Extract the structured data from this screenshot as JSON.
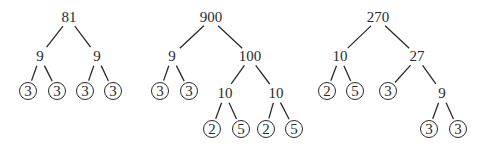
{
  "diagram": {
    "trees": [
      {
        "root": "81",
        "nodes": [
          {
            "id": "a0",
            "label": "81",
            "x": 69,
            "y": 17,
            "prime": false
          },
          {
            "id": "a1",
            "label": "9",
            "x": 40,
            "y": 56,
            "prime": false
          },
          {
            "id": "a2",
            "label": "9",
            "x": 97,
            "y": 56,
            "prime": false
          },
          {
            "id": "a3",
            "label": "3",
            "x": 28,
            "y": 91,
            "prime": true
          },
          {
            "id": "a4",
            "label": "3",
            "x": 57,
            "y": 91,
            "prime": true
          },
          {
            "id": "a5",
            "label": "3",
            "x": 85,
            "y": 91,
            "prime": true
          },
          {
            "id": "a6",
            "label": "3",
            "x": 113,
            "y": 91,
            "prime": true
          }
        ],
        "edges": [
          [
            "a0",
            "a1"
          ],
          [
            "a0",
            "a2"
          ],
          [
            "a1",
            "a3"
          ],
          [
            "a1",
            "a4"
          ],
          [
            "a2",
            "a5"
          ],
          [
            "a2",
            "a6"
          ]
        ]
      },
      {
        "root": "900",
        "nodes": [
          {
            "id": "b0",
            "label": "900",
            "x": 211,
            "y": 17,
            "prime": false
          },
          {
            "id": "b1",
            "label": "9",
            "x": 172,
            "y": 56,
            "prime": false
          },
          {
            "id": "b2",
            "label": "100",
            "x": 250,
            "y": 56,
            "prime": false
          },
          {
            "id": "b3",
            "label": "3",
            "x": 160,
            "y": 91,
            "prime": true
          },
          {
            "id": "b4",
            "label": "3",
            "x": 189,
            "y": 91,
            "prime": true
          },
          {
            "id": "b5",
            "label": "10",
            "x": 225,
            "y": 93,
            "prime": false
          },
          {
            "id": "b6",
            "label": "10",
            "x": 276,
            "y": 93,
            "prime": false
          },
          {
            "id": "b7",
            "label": "2",
            "x": 212,
            "y": 129,
            "prime": true
          },
          {
            "id": "b8",
            "label": "5",
            "x": 241,
            "y": 129,
            "prime": true
          },
          {
            "id": "b9",
            "label": "2",
            "x": 266,
            "y": 129,
            "prime": true
          },
          {
            "id": "b10",
            "label": "5",
            "x": 294,
            "y": 129,
            "prime": true
          }
        ],
        "edges": [
          [
            "b0",
            "b1"
          ],
          [
            "b0",
            "b2"
          ],
          [
            "b1",
            "b3"
          ],
          [
            "b1",
            "b4"
          ],
          [
            "b2",
            "b5"
          ],
          [
            "b2",
            "b6"
          ],
          [
            "b5",
            "b7"
          ],
          [
            "b5",
            "b8"
          ],
          [
            "b6",
            "b9"
          ],
          [
            "b6",
            "b10"
          ]
        ]
      },
      {
        "root": "270",
        "nodes": [
          {
            "id": "c0",
            "label": "270",
            "x": 378,
            "y": 17,
            "prime": false
          },
          {
            "id": "c1",
            "label": "10",
            "x": 340,
            "y": 56,
            "prime": false
          },
          {
            "id": "c2",
            "label": "27",
            "x": 417,
            "y": 56,
            "prime": false
          },
          {
            "id": "c3",
            "label": "2",
            "x": 327,
            "y": 91,
            "prime": true
          },
          {
            "id": "c4",
            "label": "5",
            "x": 355,
            "y": 91,
            "prime": true
          },
          {
            "id": "c5",
            "label": "3",
            "x": 388,
            "y": 91,
            "prime": true
          },
          {
            "id": "c6",
            "label": "9",
            "x": 442,
            "y": 93,
            "prime": false
          },
          {
            "id": "c7",
            "label": "3",
            "x": 429,
            "y": 129,
            "prime": true
          },
          {
            "id": "c8",
            "label": "3",
            "x": 458,
            "y": 129,
            "prime": true
          }
        ],
        "edges": [
          [
            "c0",
            "c1"
          ],
          [
            "c0",
            "c2"
          ],
          [
            "c1",
            "c3"
          ],
          [
            "c1",
            "c4"
          ],
          [
            "c2",
            "c5"
          ],
          [
            "c2",
            "c6"
          ],
          [
            "c6",
            "c7"
          ],
          [
            "c6",
            "c8"
          ]
        ]
      }
    ],
    "colors": {
      "ink": "#2a2a2a",
      "background": "#ffffff"
    }
  }
}
